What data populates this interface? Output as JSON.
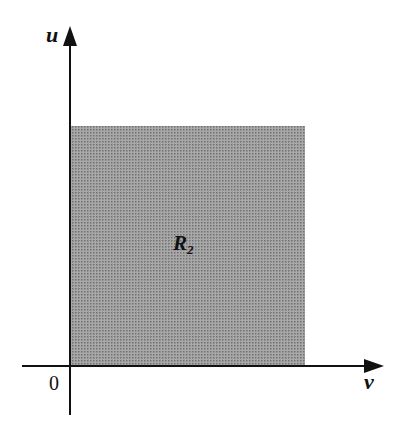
{
  "diagram": {
    "axes": {
      "vertical_label": "u",
      "horizontal_label": "v",
      "origin_label": "0"
    },
    "region": {
      "label": "R",
      "subscript": "2",
      "fill_color": "#9a9a9a"
    }
  }
}
